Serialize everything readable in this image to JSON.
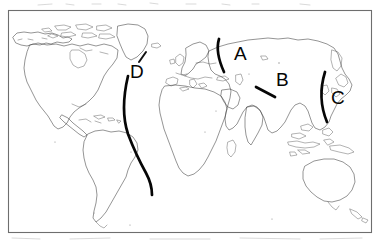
{
  "figure": {
    "type": "outline-world-map",
    "title": "",
    "background_color": "#ffffff",
    "frame": {
      "present": true,
      "color": "#6e6e6e",
      "x": 8,
      "y": 10,
      "width": 364,
      "height": 223
    },
    "coastline_color": "#3c3c3c",
    "marker_color": "#060606"
  },
  "labels": [
    {
      "id": "label-a",
      "text": "A",
      "x": 234,
      "y": 60,
      "marker_shape": "arc-left-opening",
      "region": "northern-eurasia"
    },
    {
      "id": "label-b",
      "text": "B",
      "x": 276,
      "y": 86,
      "marker_shape": "short-diagonal-line",
      "region": "central-asia"
    },
    {
      "id": "label-c",
      "text": "C",
      "x": 331,
      "y": 104,
      "marker_shape": "long-vertical-arc",
      "region": "east-asia-pacific-margin"
    },
    {
      "id": "label-d",
      "text": "D",
      "x": 130,
      "y": 78,
      "marker_shape": "long-sinuous-curve",
      "region": "atlantic-ocean"
    }
  ],
  "markers": {
    "a_arc_label": "A",
    "b_line_label": "B",
    "c_arc_label": "C",
    "d_curve_label": "D",
    "d_tick_label": "D pointer tick"
  },
  "landmasses": [
    "north-america",
    "south-america",
    "greenland",
    "europe",
    "africa",
    "asia",
    "india",
    "arabia",
    "japan",
    "indonesia",
    "australia",
    "new-zealand",
    "madagascar",
    "british-isles"
  ]
}
